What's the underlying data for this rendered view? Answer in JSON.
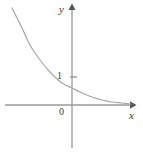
{
  "figure": {
    "kind": "cartesian-graph",
    "background_color": "#ffffff",
    "width": 143,
    "height": 155
  },
  "labels": {
    "y_axis": "y",
    "x_axis": "x",
    "origin": "0",
    "tick_one": "1"
  },
  "colors": {
    "axis": "#9a9a9a",
    "curve": "#a8a8a8",
    "text": "#3a3a3a",
    "arrow": "#555555"
  },
  "chart_data": {
    "type": "line",
    "title": "",
    "subtitle": "",
    "xlabel": "x",
    "ylabel": "y",
    "legend": [],
    "annotations": [],
    "grid": false,
    "legend_position": "none",
    "axes": {
      "x_axis_pixel_y": 105,
      "y_axis_pixel_x": 72,
      "x_axis_from_pixel_x": 5,
      "x_axis_to_pixel_x": 133,
      "y_axis_from_pixel_y": 148,
      "y_axis_to_pixel_y": 6,
      "x_arrow": true,
      "y_arrow": true,
      "xlim": [
        -2.4,
        2.9
      ],
      "ylim": [
        -1.6,
        3.7
      ]
    },
    "ticks": {
      "x": [],
      "y": [
        {
          "value": 1,
          "label": "1",
          "pixel_y": 77
        }
      ]
    },
    "series": [
      {
        "name": "exponential-decay",
        "x": [
          -2.2,
          -1.8,
          -1.4,
          -1.0,
          -0.6,
          -0.2,
          0.0,
          0.3,
          0.7,
          1.1,
          1.6,
          2.1,
          2.6
        ],
        "y": [
          3.55,
          2.9,
          2.3,
          1.78,
          1.3,
          0.88,
          0.72,
          0.52,
          0.35,
          0.24,
          0.15,
          0.09,
          0.05
        ],
        "pixel_points": [
          [
            12,
            8
          ],
          [
            22,
            28
          ],
          [
            30,
            45
          ],
          [
            40,
            60
          ],
          [
            50,
            72
          ],
          [
            62,
            83
          ],
          [
            72,
            88
          ],
          [
            82,
            93
          ],
          [
            92,
            97
          ],
          [
            102,
            100
          ],
          [
            112,
            102
          ],
          [
            122,
            103
          ],
          [
            131,
            104
          ]
        ]
      }
    ]
  }
}
